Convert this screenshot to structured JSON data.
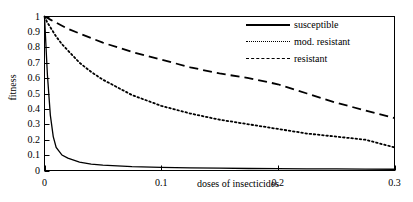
{
  "chart_data": {
    "type": "line",
    "title": "",
    "xlabel": "doses of insecticides",
    "ylabel": "fitness",
    "xlim": [
      0,
      0.3
    ],
    "ylim": [
      0,
      1
    ],
    "grid": false,
    "legend_position": "top-right",
    "xticks": [
      "0",
      "0.1",
      "0.2",
      "0.3"
    ],
    "xtick_values": [
      0,
      0.1,
      0.2,
      0.3
    ],
    "yticks": [
      "0",
      "0.1",
      "0.2",
      "0.3",
      "0.4",
      "0.5",
      "0.6",
      "0.7",
      "0.8",
      "0.9",
      "1"
    ],
    "ytick_values": [
      0,
      0.1,
      0.2,
      0.3,
      0.4,
      0.5,
      0.6,
      0.7,
      0.8,
      0.9,
      1
    ],
    "x": [
      0,
      0.0025,
      0.005,
      0.0075,
      0.01,
      0.015,
      0.02,
      0.03,
      0.04,
      0.05,
      0.075,
      0.1,
      0.125,
      0.15,
      0.175,
      0.2,
      0.225,
      0.25,
      0.275,
      0.3
    ],
    "series": [
      {
        "name": "susceptible",
        "style": "solid",
        "values": [
          1.0,
          0.62,
          0.36,
          0.22,
          0.15,
          0.1,
          0.08,
          0.055,
          0.042,
          0.035,
          0.025,
          0.02,
          0.017,
          0.015,
          0.013,
          0.012,
          0.011,
          0.01,
          0.009,
          0.008
        ]
      },
      {
        "name": "mod. resistant",
        "style": "dotted",
        "values": [
          1.0,
          0.96,
          0.93,
          0.9,
          0.87,
          0.82,
          0.78,
          0.7,
          0.64,
          0.59,
          0.49,
          0.42,
          0.37,
          0.33,
          0.3,
          0.27,
          0.24,
          0.22,
          0.2,
          0.15
        ]
      },
      {
        "name": "resistant",
        "style": "dashed",
        "values": [
          1.0,
          0.99,
          0.98,
          0.97,
          0.96,
          0.94,
          0.92,
          0.89,
          0.86,
          0.83,
          0.77,
          0.72,
          0.67,
          0.63,
          0.6,
          0.56,
          0.5,
          0.44,
          0.39,
          0.34
        ]
      }
    ]
  },
  "legend": {
    "items": [
      {
        "label": "susceptible",
        "sample": "solid-line-sample"
      },
      {
        "label": "mod. resistant",
        "sample": "dotted-line-sample"
      },
      {
        "label": "resistant",
        "sample": "dashed-line-sample"
      }
    ]
  }
}
